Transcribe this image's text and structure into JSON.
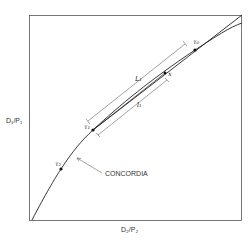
{
  "diagram": {
    "type": "concordia-diagram",
    "axes": {
      "x_label": "D₂/P₂",
      "y_label": "D₁/P₁"
    },
    "curve_label": "CONCORDIA",
    "points": [
      {
        "id": "tau0",
        "label": "τ₀"
      },
      {
        "id": "tau1",
        "label": "τ₁"
      },
      {
        "id": "tau2",
        "label": "τ₂"
      },
      {
        "id": "x",
        "label": "x"
      }
    ],
    "dimensions": [
      {
        "id": "L1",
        "label": "L₁"
      },
      {
        "id": "l1",
        "label": "l₁"
      }
    ]
  }
}
